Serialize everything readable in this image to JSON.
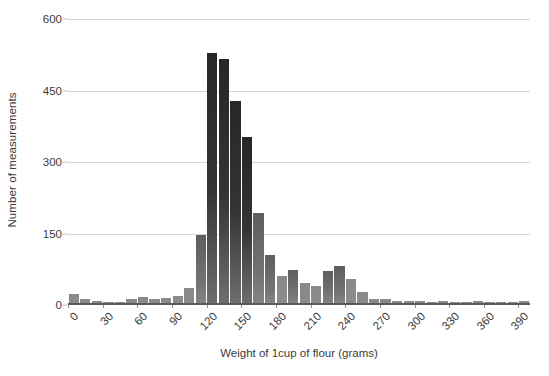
{
  "chart_data": {
    "type": "bar",
    "title": "",
    "xlabel": "Weight of 1cup of flour (grams)",
    "ylabel": "Number of measurements",
    "xlim": [
      0,
      400
    ],
    "ylim": [
      0,
      600
    ],
    "grid": true,
    "legend": false,
    "bin_width": 10,
    "y_ticks": [
      0,
      150,
      300,
      450,
      600
    ],
    "x_ticks": [
      0,
      30,
      60,
      90,
      120,
      150,
      180,
      210,
      240,
      270,
      300,
      330,
      360,
      390
    ],
    "y_tick_labels": [
      "0",
      "150",
      "300",
      "450",
      "600"
    ],
    "x_tick_labels": [
      "0",
      "30",
      "60",
      "90",
      "120",
      "150",
      "180",
      "210",
      "240",
      "270",
      "300",
      "330",
      "360",
      "390"
    ],
    "categories": [
      0,
      10,
      20,
      30,
      40,
      50,
      60,
      70,
      80,
      90,
      100,
      110,
      120,
      130,
      140,
      150,
      160,
      170,
      180,
      190,
      200,
      210,
      220,
      230,
      240,
      250,
      260,
      270,
      280,
      290,
      300,
      310,
      320,
      330,
      340,
      350,
      360,
      370,
      380,
      390
    ],
    "values": [
      20,
      10,
      6,
      2,
      3,
      10,
      13,
      9,
      11,
      15,
      33,
      143,
      525,
      512,
      425,
      350,
      190,
      102,
      58,
      70,
      42,
      37,
      67,
      78,
      52,
      25,
      10,
      9,
      6,
      5,
      5,
      4,
      5,
      3,
      3,
      5,
      4,
      3,
      3,
      5
    ],
    "bar_color_dark": "#2b2b2b",
    "bar_color_mid": "#6e6e6e",
    "bar_color_light": "#8a8a8a",
    "gridline_color": "#d4d4d4",
    "axis_color": "#5a5a5a",
    "background": "#ffffff"
  }
}
